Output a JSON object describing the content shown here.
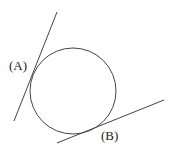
{
  "diagram": {
    "circle": {
      "cx": 73,
      "cy": 91,
      "r": 43,
      "stroke": "#444444"
    },
    "lines": [
      {
        "id": "A",
        "x1": 57,
        "y1": 12,
        "x2": 14,
        "y2": 121,
        "stroke": "#444444"
      },
      {
        "id": "B",
        "x1": 57,
        "y1": 143,
        "x2": 164,
        "y2": 100,
        "stroke": "#444444"
      }
    ],
    "labels": {
      "a": "(A)",
      "b": "(B)"
    }
  }
}
